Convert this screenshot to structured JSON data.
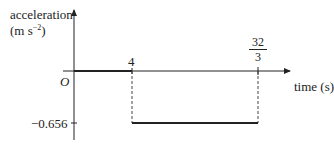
{
  "diagram": {
    "type": "acceleration-time graph",
    "y_axis": {
      "label_line1": "acceleration",
      "label_line2_prefix": "(m s",
      "label_line2_exponent": "−2",
      "label_line2_suffix": ")"
    },
    "x_axis": {
      "label": "time (s)"
    },
    "origin_label": "O",
    "x_ticks": [
      {
        "label": "4",
        "value": 4
      },
      {
        "numerator": "32",
        "denominator": "3",
        "value": 10.667
      }
    ],
    "y_ticks": [
      {
        "label": "−0.656",
        "value": -0.656
      }
    ],
    "segments": [
      {
        "from_t": 0,
        "to_t": 4,
        "a": 0
      },
      {
        "from_t": 4,
        "to_t": 10.667,
        "a": -0.656
      }
    ],
    "colors": {
      "line": "#222222",
      "dashed": "#444444"
    }
  }
}
